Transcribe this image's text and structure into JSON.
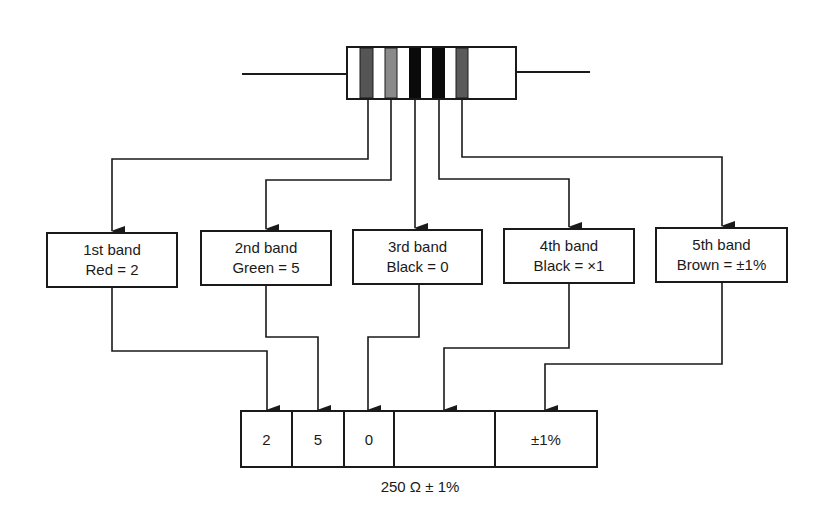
{
  "resistor": {
    "bands": [
      {
        "position": "1st",
        "color_name": "Red",
        "fill": "#555555"
      },
      {
        "position": "2nd",
        "color_name": "Green",
        "fill": "#8a8a8a"
      },
      {
        "position": "3rd",
        "color_name": "Black",
        "fill": "#0a0a0a"
      },
      {
        "position": "4th",
        "color_name": "Black",
        "fill": "#0a0a0a"
      },
      {
        "position": "5th",
        "color_name": "Brown",
        "fill": "#5a5a5a"
      }
    ]
  },
  "band_boxes": [
    {
      "title": "1st band",
      "value": "Red = 2"
    },
    {
      "title": "2nd band",
      "value": "Green = 5"
    },
    {
      "title": "3rd band",
      "value": "Black = 0"
    },
    {
      "title": "4th band",
      "value": "Black = ×1"
    },
    {
      "title": "5th band",
      "value": "Brown = ±1%"
    }
  ],
  "value_row": {
    "cells": [
      "2",
      "5",
      "0",
      "",
      "±1%"
    ]
  },
  "result": {
    "caption": "250 Ω ± 1%"
  },
  "colors": {
    "line": "#1a1a1a",
    "background": "#ffffff"
  }
}
